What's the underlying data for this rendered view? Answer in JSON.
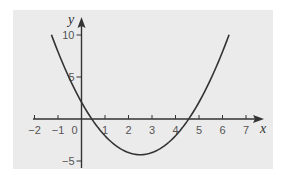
{
  "chart_data": {
    "type": "line",
    "title": "",
    "xlabel": "x",
    "ylabel": "y",
    "function": "y = x^2 - 5x + 2",
    "xlim": [
      -2,
      7
    ],
    "ylim": [
      -5,
      10
    ],
    "x_ticks": [
      -2,
      -1,
      0,
      1,
      2,
      3,
      4,
      5,
      6,
      7
    ],
    "x_tick_labels": [
      "−2",
      "−1",
      "0",
      "1",
      "2",
      "3",
      "4",
      "5",
      "6",
      "7"
    ],
    "y_ticks": [
      -5,
      5,
      10
    ],
    "y_tick_labels": [
      "−5",
      "5",
      "10"
    ],
    "grid": false,
    "legend": null,
    "series": [
      {
        "name": "parabola",
        "x": [
          -1.28,
          -1,
          -0.5,
          0,
          0.5,
          1,
          1.5,
          2,
          2.5,
          3,
          3.5,
          4,
          4.5,
          5,
          5.5,
          6,
          6.28
        ],
        "values": [
          10.04,
          8,
          4.75,
          2,
          -0.25,
          -2,
          -3.25,
          -4,
          -4.25,
          -4,
          -3.25,
          -2,
          -0.25,
          2,
          4.75,
          8,
          10.04
        ]
      }
    ],
    "roots": [
      0.44,
      4.56
    ],
    "vertex": [
      2.5,
      -4.25
    ],
    "y_intercept": 2
  },
  "colors": {
    "panel_background": "#ebebeb",
    "axis": "#333333",
    "curve": "#333333"
  }
}
